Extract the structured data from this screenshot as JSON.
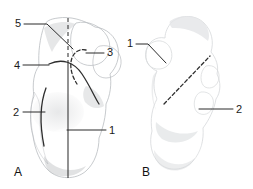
{
  "figure": {
    "background_color": "#ffffff",
    "ink_color": "#2b2b2b",
    "panels": [
      {
        "id": "A",
        "letter": "A",
        "subject": "bone-specimen-lateral-view",
        "letter_x": 14,
        "letter_y": 176,
        "labels": [
          {
            "id": "a5",
            "text": "5",
            "x": 18,
            "y": 27,
            "leader": "M24,24 L47,24 L73,49"
          },
          {
            "id": "a4",
            "text": "4",
            "x": 17,
            "y": 69,
            "leader": "M23,65 L49,65"
          },
          {
            "id": "a3",
            "text": "3",
            "x": 107,
            "y": 56,
            "leader": "M104,53 L86,53"
          },
          {
            "id": "a2",
            "text": "2",
            "x": 16,
            "y": 116,
            "leader": "M23,112 L45,112"
          },
          {
            "id": "a1",
            "text": "1",
            "x": 109,
            "y": 134,
            "leader": "M106,130 L67,130"
          }
        ]
      },
      {
        "id": "B",
        "letter": "B",
        "subject": "bone-specimen-medial-view",
        "letter_x": 142,
        "letter_y": 176,
        "labels": [
          {
            "id": "b1",
            "text": "1",
            "x": 130,
            "y": 47,
            "leader": "M136,44 L148,44 L166,63"
          },
          {
            "id": "b2",
            "text": "2",
            "x": 236,
            "y": 113,
            "leader": "M233,109 L199,109"
          }
        ]
      }
    ],
    "annotation_lines": {
      "panel_a_vertical_dashed": "M68,18 L68,62",
      "panel_a_vertical_solid": "M68,62 L68,178",
      "panel_a_contour_upper": "M49,64 C62,58 74,62 82,74 C90,86 94,96 99,104",
      "panel_a_contour_left": "M46,88 C40,104 40,126 44,146",
      "panel_a_contour_dashed_arc": "M86,50 C78,48 72,54 71,62 C70,70 73,78 77,84",
      "panel_b_dashed_diagonal": "M164,104 L210,56"
    }
  }
}
